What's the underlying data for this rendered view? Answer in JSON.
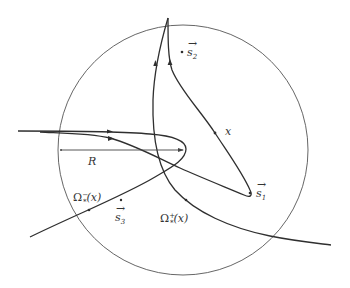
{
  "figure": {
    "type": "diagram",
    "colors": {
      "ink": "#2f2f2f",
      "circle": "#555555",
      "background": "#ffffff"
    }
  },
  "labels": {
    "s2": "s",
    "s2_sub": "2",
    "s1": "s",
    "s1_sub": "1",
    "s3": "s",
    "s3_sub": "3",
    "x": "x",
    "R": "R",
    "omega_minus": "Ω",
    "omega_minus_sub": "*",
    "omega_minus_sup": "−",
    "omega_minus_arg": "(x)",
    "omega_plus": "Ω",
    "omega_plus_sub": "*",
    "omega_plus_sup": "+",
    "omega_plus_arg": "(x)",
    "vec_arrow": "→"
  }
}
